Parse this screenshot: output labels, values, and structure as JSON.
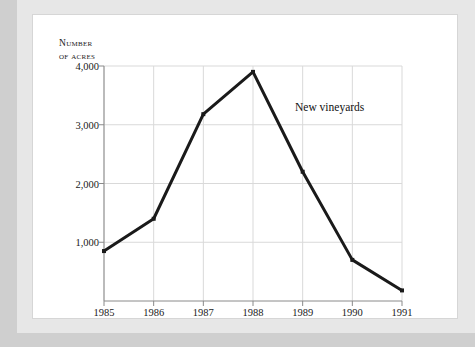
{
  "figure": {
    "background_color": "#ffffff",
    "page_border_color": "#d6d6d6",
    "outer_margin_color": "#e7e7e7",
    "canvas_color": "#cfcfcf"
  },
  "axis_title": {
    "line1": "Number",
    "line2": "of acres"
  },
  "annotation": {
    "series_label": "New vineyards"
  },
  "chart_data": {
    "type": "line",
    "title": "",
    "subtitle": "",
    "xlabel": "",
    "ylabel": "Number of acres",
    "categories": [
      "1985",
      "1986",
      "1987",
      "1988",
      "1989",
      "1990",
      "1991"
    ],
    "x": [
      1985,
      1986,
      1987,
      1988,
      1989,
      1990,
      1991
    ],
    "series": [
      {
        "name": "New vineyards",
        "values": [
          850,
          1400,
          3180,
          3900,
          2200,
          700,
          180
        ],
        "color": "#1a1a1a",
        "line_width": 3,
        "marker": "square",
        "marker_size": 4
      }
    ],
    "xlim": [
      1985,
      1991
    ],
    "ylim": [
      0,
      4000
    ],
    "ytick_values": [
      1000,
      2000,
      3000,
      4000
    ],
    "ytick_labels": [
      "1,000",
      "2,000",
      "3,000",
      "4,000"
    ],
    "xtick_labels": [
      "1985",
      "1986",
      "1987",
      "1988",
      "1989",
      "1990",
      "1991"
    ],
    "grid": true,
    "grid_color": "#d9d9d9",
    "axis_color": "#8a8a8a",
    "legend": "none",
    "legend_position": "inline-annotation"
  }
}
